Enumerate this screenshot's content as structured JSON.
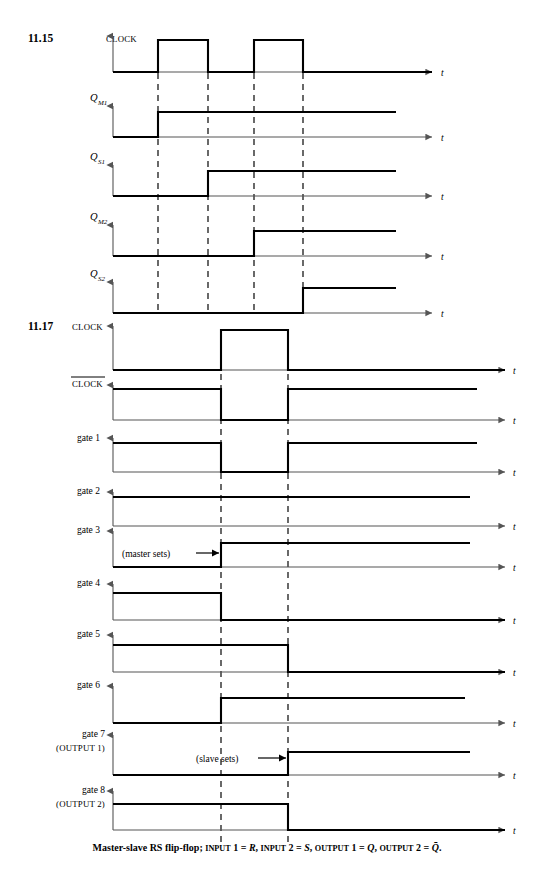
{
  "page": {
    "width": 534,
    "height": 879,
    "background": "#ffffff",
    "ink": "#000000",
    "axis_color": "#555555"
  },
  "geometry": {
    "axis_x_start": 113,
    "axis_x_end": 505,
    "trace_x_end": 396,
    "arrow_label_x": 512
  },
  "figures": [
    {
      "id": "fig-11-15",
      "number": "11.15",
      "number_x": 28,
      "number_y": 42,
      "t_ticks": [
        158,
        208,
        254,
        303
      ],
      "dash_top": 40,
      "dash_bottom": 313,
      "trace_right": 396,
      "rows": [
        {
          "name": "clock",
          "label_kind": "smallcaps",
          "label": "CLOCK",
          "label_sub": "",
          "label_x": 106,
          "label_y": 42,
          "baseline_y": 72,
          "high_y": 40,
          "axis_top_y": 36,
          "axis_right": 432,
          "t_label": "t",
          "t_label_x": 441,
          "segments": [
            {
              "from": 113,
              "to": 158,
              "level": "low"
            },
            {
              "from": 158,
              "to": 208,
              "level": "high"
            },
            {
              "from": 208,
              "to": 254,
              "level": "low"
            },
            {
              "from": 254,
              "to": 303,
              "level": "high"
            },
            {
              "from": 303,
              "to": 432,
              "level": "low"
            }
          ]
        },
        {
          "name": "q-m1",
          "label_kind": "math",
          "label": "Q",
          "label_sub": "M1",
          "label_x": 90,
          "label_y": 101,
          "baseline_y": 137,
          "high_y": 112,
          "axis_top_y": 106,
          "axis_right": 432,
          "t_label": "t",
          "t_label_x": 441,
          "segments": [
            {
              "from": 113,
              "to": 158,
              "level": "low"
            },
            {
              "from": 158,
              "to": 396,
              "level": "high"
            }
          ]
        },
        {
          "name": "q-s1",
          "label_kind": "math",
          "label": "Q",
          "label_sub": "S1",
          "label_x": 90,
          "label_y": 160,
          "baseline_y": 196,
          "high_y": 171,
          "axis_top_y": 165,
          "axis_right": 432,
          "t_label": "t",
          "t_label_x": 441,
          "segments": [
            {
              "from": 113,
              "to": 208,
              "level": "low"
            },
            {
              "from": 208,
              "to": 396,
              "level": "high"
            }
          ]
        },
        {
          "name": "q-m2",
          "label_kind": "math",
          "label": "Q",
          "label_sub": "M2",
          "label_x": 90,
          "label_y": 220,
          "baseline_y": 256,
          "high_y": 231,
          "axis_top_y": 225,
          "axis_right": 432,
          "t_label": "t",
          "t_label_x": 441,
          "segments": [
            {
              "from": 113,
              "to": 254,
              "level": "low"
            },
            {
              "from": 254,
              "to": 396,
              "level": "high"
            }
          ]
        },
        {
          "name": "q-s2",
          "label_kind": "math",
          "label": "Q",
          "label_sub": "S2",
          "label_x": 90,
          "label_y": 277,
          "baseline_y": 313,
          "high_y": 288,
          "axis_top_y": 282,
          "axis_right": 432,
          "t_label": "t",
          "t_label_x": 441,
          "segments": [
            {
              "from": 113,
              "to": 303,
              "level": "low"
            },
            {
              "from": 303,
              "to": 396,
              "level": "high"
            }
          ]
        }
      ]
    },
    {
      "id": "fig-11-17",
      "number": "11.17",
      "number_x": 28,
      "number_y": 330,
      "t_ticks": [
        221,
        288
      ],
      "dash_top": 330,
      "dash_bottom": 845,
      "rows": [
        {
          "name": "clock",
          "label_kind": "smallcaps",
          "label": "CLOCK",
          "label_sub": "",
          "label_x": 72,
          "label_y": 330,
          "baseline_y": 370,
          "high_y": 330,
          "axis_top_y": 326,
          "axis_right": 505,
          "trace_right": 505,
          "t_label": "t",
          "t_label_x": 513,
          "segments": [
            {
              "from": 113,
              "to": 221,
              "level": "low"
            },
            {
              "from": 221,
              "to": 288,
              "level": "high"
            },
            {
              "from": 288,
              "to": 505,
              "level": "low"
            }
          ]
        },
        {
          "name": "clock-bar",
          "label_kind": "smallcaps-overbar",
          "label": "CLOCK",
          "label_sub": "",
          "label_x": 72,
          "label_y": 387,
          "baseline_y": 420,
          "high_y": 389,
          "axis_top_y": 385,
          "axis_right": 505,
          "trace_right": 477,
          "t_label": "t",
          "t_label_x": 513,
          "segments": [
            {
              "from": 113,
              "to": 221,
              "level": "high"
            },
            {
              "from": 221,
              "to": 288,
              "level": "low"
            },
            {
              "from": 288,
              "to": 477,
              "level": "high"
            }
          ]
        },
        {
          "name": "gate-1",
          "label_kind": "plain",
          "label": "gate 1",
          "label_sub": "",
          "label_x": 77,
          "label_y": 441,
          "baseline_y": 472,
          "high_y": 443,
          "axis_top_y": 438,
          "axis_right": 505,
          "trace_right": 477,
          "t_label": "t",
          "t_label_x": 513,
          "segments": [
            {
              "from": 113,
              "to": 221,
              "level": "high"
            },
            {
              "from": 221,
              "to": 288,
              "level": "low"
            },
            {
              "from": 288,
              "to": 477,
              "level": "high"
            }
          ]
        },
        {
          "name": "gate-2",
          "label_kind": "plain",
          "label": "gate 2",
          "label_sub": "",
          "label_x": 77,
          "label_y": 494,
          "baseline_y": 526,
          "high_y": 497,
          "axis_top_y": 492,
          "axis_right": 505,
          "trace_right": 470,
          "t_label": "t",
          "t_label_x": 513,
          "segments": [
            {
              "from": 113,
              "to": 470,
              "level": "high"
            }
          ]
        },
        {
          "name": "gate-3",
          "label_kind": "plain",
          "label": "gate 3",
          "label_sub": "",
          "label_x": 77,
          "label_y": 533,
          "baseline_y": 567,
          "high_y": 543,
          "axis_top_y": 531,
          "axis_right": 505,
          "trace_right": 470,
          "t_label": "t",
          "t_label_x": 513,
          "annotation": {
            "text": "(master sets)",
            "text_x": 122,
            "text_y": 557,
            "arrow_from_x": 196,
            "arrow_to_x": 219,
            "arrow_y": 553
          },
          "segments": [
            {
              "from": 113,
              "to": 221,
              "level": "low"
            },
            {
              "from": 221,
              "to": 470,
              "level": "high"
            }
          ]
        },
        {
          "name": "gate-4",
          "label_kind": "plain",
          "label": "gate 4",
          "label_sub": "",
          "label_x": 77,
          "label_y": 586,
          "baseline_y": 620,
          "high_y": 593,
          "axis_top_y": 584,
          "axis_right": 505,
          "trace_right": 470,
          "t_label": "t",
          "t_label_x": 513,
          "segments": [
            {
              "from": 113,
              "to": 221,
              "level": "high"
            },
            {
              "from": 221,
              "to": 505,
              "level": "low"
            }
          ]
        },
        {
          "name": "gate-5",
          "label_kind": "plain",
          "label": "gate 5",
          "label_sub": "",
          "label_x": 77,
          "label_y": 637,
          "baseline_y": 672,
          "high_y": 645,
          "axis_top_y": 635,
          "axis_right": 505,
          "trace_right": 470,
          "t_label": "t",
          "t_label_x": 513,
          "segments": [
            {
              "from": 113,
              "to": 288,
              "level": "high"
            },
            {
              "from": 288,
              "to": 505,
              "level": "low"
            }
          ]
        },
        {
          "name": "gate-6",
          "label_kind": "plain",
          "label": "gate 6",
          "label_sub": "",
          "label_x": 77,
          "label_y": 688,
          "baseline_y": 723,
          "high_y": 698,
          "axis_top_y": 686,
          "axis_right": 505,
          "trace_right": 465,
          "t_label": "t",
          "t_label_x": 513,
          "segments": [
            {
              "from": 113,
              "to": 221,
              "level": "low"
            },
            {
              "from": 221,
              "to": 465,
              "level": "high"
            }
          ]
        },
        {
          "name": "gate-7",
          "label_kind": "two-line",
          "label": "gate 7",
          "label_line2": "(OUTPUT 1)",
          "label_sub": "",
          "label_x": 77,
          "label_y": 737,
          "baseline_y": 775,
          "high_y": 752,
          "axis_top_y": 735,
          "axis_right": 505,
          "trace_right": 470,
          "t_label": "t",
          "t_label_x": 513,
          "annotation": {
            "text": "(slave sets)",
            "text_x": 196,
            "text_y": 762,
            "arrow_from_x": 258,
            "arrow_to_x": 286,
            "arrow_y": 758
          },
          "segments": [
            {
              "from": 113,
              "to": 288,
              "level": "low"
            },
            {
              "from": 288,
              "to": 470,
              "level": "high"
            }
          ]
        },
        {
          "name": "gate-8",
          "label_kind": "two-line",
          "label": "gate 8",
          "label_line2": "(OUTPUT 2)",
          "label_sub": "",
          "label_x": 77,
          "label_y": 793,
          "baseline_y": 830,
          "high_y": 804,
          "axis_top_y": 791,
          "axis_right": 505,
          "trace_right": 478,
          "t_label": "t",
          "t_label_x": 513,
          "segments": [
            {
              "from": 113,
              "to": 288,
              "level": "high"
            },
            {
              "from": 288,
              "to": 505,
              "level": "low"
            }
          ]
        }
      ]
    }
  ],
  "caption": {
    "prefix": "Master-slave RS flip-flop;",
    "parts": [
      {
        "sc": "INPUT",
        "rest": " 1 = ",
        "ital": "R",
        "tail": ","
      },
      {
        "sc": "INPUT",
        "rest": " 2 = ",
        "ital": "S",
        "tail": ","
      },
      {
        "sc": "OUTPUT",
        "rest": " 1 = ",
        "ital": "Q",
        "tail": ","
      },
      {
        "sc": "OUTPUT",
        "rest": " 2 = ",
        "ital": "Q",
        "overbar": true,
        "tail": "."
      }
    ],
    "full_text": "Master-slave RS flip-flop; INPUT 1 = R, INPUT 2 = S, OUTPUT 1 = Q, OUTPUT 2 = Q̄.",
    "y": 851
  },
  "chart_data": {
    "type": "line",
    "xlabel": "t",
    "figures": [
      {
        "number": "11.15",
        "signals": [
          {
            "name": "CLOCK",
            "transitions_high": [
              [
                158,
                208
              ],
              [
                254,
                303
              ]
            ]
          },
          {
            "name": "Q_M1",
            "transitions_high": [
              [
                158,
                396
              ]
            ]
          },
          {
            "name": "Q_S1",
            "transitions_high": [
              [
                208,
                396
              ]
            ]
          },
          {
            "name": "Q_M2",
            "transitions_high": [
              [
                254,
                396
              ]
            ]
          },
          {
            "name": "Q_S2",
            "transitions_high": [
              [
                303,
                396
              ]
            ]
          }
        ]
      },
      {
        "number": "11.17",
        "signals": [
          {
            "name": "CLOCK",
            "transitions_high": [
              [
                221,
                288
              ]
            ]
          },
          {
            "name": "CLOCK-bar",
            "transitions_high": [
              [
                113,
                221
              ],
              [
                288,
                477
              ]
            ]
          },
          {
            "name": "gate 1",
            "transitions_high": [
              [
                113,
                221
              ],
              [
                288,
                477
              ]
            ]
          },
          {
            "name": "gate 2",
            "transitions_high": [
              [
                113,
                470
              ]
            ]
          },
          {
            "name": "gate 3",
            "transitions_high": [
              [
                221,
                470
              ]
            ]
          },
          {
            "name": "gate 4",
            "transitions_high": [
              [
                113,
                221
              ]
            ]
          },
          {
            "name": "gate 5",
            "transitions_high": [
              [
                113,
                288
              ]
            ]
          },
          {
            "name": "gate 6",
            "transitions_high": [
              [
                221,
                465
              ]
            ]
          },
          {
            "name": "gate 7 (OUTPUT 1)",
            "transitions_high": [
              [
                288,
                470
              ]
            ]
          },
          {
            "name": "gate 8 (OUTPUT 2)",
            "transitions_high": [
              [
                113,
                288
              ]
            ]
          }
        ]
      }
    ]
  }
}
